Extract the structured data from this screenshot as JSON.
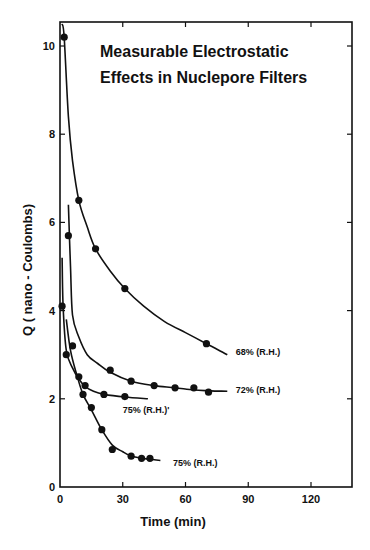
{
  "chart_data": {
    "type": "scatter",
    "title": "Measurable Electrostatic Effects in Nuclepore Filters",
    "title_lines": [
      "Measurable Electrostatic",
      "Effects in Nuclepore Filters"
    ],
    "xlabel": "Time (min)",
    "ylabel": "Q ( nano - Coulombs)",
    "xlim": [
      0,
      138
    ],
    "ylim": [
      0,
      10.5
    ],
    "x_ticks": [
      0,
      30,
      60,
      90,
      120
    ],
    "y_ticks": [
      0,
      2,
      4,
      6,
      8,
      10
    ],
    "grid": false,
    "legend_position": "inline labels at curve ends",
    "series": [
      {
        "name": "68% (R.H.)",
        "points": [
          [
            2,
            10.2
          ],
          [
            9,
            6.5
          ],
          [
            17,
            5.4
          ],
          [
            31,
            4.5
          ],
          [
            70,
            3.25
          ]
        ],
        "curve": [
          [
            1,
            10.5
          ],
          [
            2,
            10.2
          ],
          [
            4,
            8.4
          ],
          [
            6,
            7.4
          ],
          [
            9,
            6.5
          ],
          [
            13,
            5.9
          ],
          [
            17,
            5.4
          ],
          [
            24,
            4.9
          ],
          [
            31,
            4.5
          ],
          [
            40,
            4.1
          ],
          [
            50,
            3.75
          ],
          [
            60,
            3.5
          ],
          [
            70,
            3.25
          ],
          [
            80,
            3.0
          ]
        ],
        "label_pos": [
          84,
          3.05
        ]
      },
      {
        "name": "72% (R.H.)",
        "points": [
          [
            4,
            5.7
          ],
          [
            6,
            3.2
          ],
          [
            24,
            2.65
          ],
          [
            34,
            2.4
          ],
          [
            45,
            2.3
          ],
          [
            55,
            2.25
          ],
          [
            64,
            2.25
          ],
          [
            71,
            2.15
          ]
        ],
        "curve": [
          [
            4,
            6.4
          ],
          [
            5,
            5.0
          ],
          [
            6,
            3.9
          ],
          [
            9,
            3.4
          ],
          [
            13,
            3.0
          ],
          [
            18,
            2.8
          ],
          [
            24,
            2.6
          ],
          [
            34,
            2.4
          ],
          [
            45,
            2.3
          ],
          [
            55,
            2.25
          ],
          [
            64,
            2.2
          ],
          [
            72,
            2.18
          ],
          [
            80,
            2.17
          ]
        ],
        "label_pos": [
          84,
          2.2
        ]
      },
      {
        "name": "75% (R.H.)'",
        "points": [
          [
            1,
            4.1
          ],
          [
            3,
            3.0
          ],
          [
            9,
            2.5
          ],
          [
            12,
            2.3
          ],
          [
            21,
            2.1
          ],
          [
            31,
            2.05
          ]
        ],
        "curve": [
          [
            1,
            5.2
          ],
          [
            1.5,
            4.1
          ],
          [
            3,
            3.1
          ],
          [
            6,
            2.7
          ],
          [
            9,
            2.45
          ],
          [
            12,
            2.28
          ],
          [
            16,
            2.17
          ],
          [
            21,
            2.1
          ],
          [
            31,
            2.04
          ],
          [
            42,
            2.0
          ]
        ],
        "label_pos": [
          30,
          1.75
        ]
      },
      {
        "name": "75% (R.H.)",
        "points": [
          [
            11,
            2.1
          ],
          [
            15,
            1.8
          ],
          [
            20,
            1.3
          ],
          [
            25,
            0.85
          ],
          [
            34,
            0.7
          ],
          [
            39,
            0.65
          ],
          [
            43,
            0.65
          ]
        ],
        "curve": [
          [
            3,
            3.8
          ],
          [
            5,
            3.1
          ],
          [
            8,
            2.55
          ],
          [
            11,
            2.1
          ],
          [
            15,
            1.75
          ],
          [
            20,
            1.3
          ],
          [
            25,
            0.95
          ],
          [
            30,
            0.8
          ],
          [
            34,
            0.7
          ],
          [
            39,
            0.65
          ],
          [
            43,
            0.63
          ],
          [
            48,
            0.6
          ]
        ],
        "label_pos": [
          54,
          0.55
        ]
      }
    ]
  }
}
